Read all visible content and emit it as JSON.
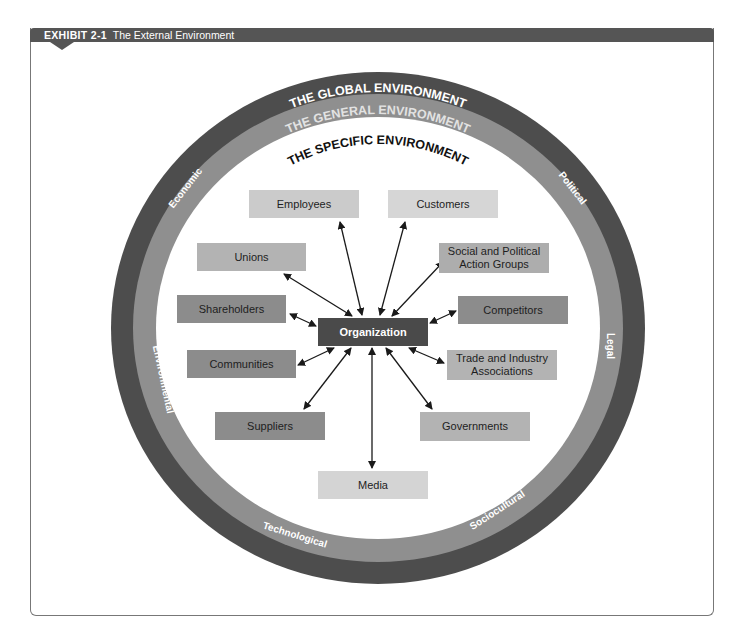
{
  "header": {
    "exhibit_number": "EXHIBIT 2-1",
    "title": "The External Environment",
    "bar_color": "#555555"
  },
  "rings": {
    "global": {
      "label": "THE GLOBAL ENVIRONMENT",
      "color": "#4d4d4d"
    },
    "general": {
      "label": "THE GENERAL ENVIRONMENT",
      "color": "#8f8f8f",
      "segments": [
        "Economic",
        "Political",
        "Legal",
        "Sociocultural",
        "Technological",
        "Environmental"
      ]
    },
    "specific": {
      "label": "THE SPECIFIC ENVIRONMENT",
      "color": "#ffffff"
    }
  },
  "center": {
    "label": "Organization",
    "color": "#4a4a4a"
  },
  "stakeholders": [
    {
      "id": "employees",
      "label": "Employees",
      "color": "#cbcbcb"
    },
    {
      "id": "customers",
      "label": "Customers",
      "color": "#d6d6d6"
    },
    {
      "id": "unions",
      "label": "Unions",
      "color": "#b3b3b3"
    },
    {
      "id": "social-political",
      "label": "Social and Political Action Groups",
      "color": "#adadad"
    },
    {
      "id": "shareholders",
      "label": "Shareholders",
      "color": "#8c8c8c"
    },
    {
      "id": "competitors",
      "label": "Competitors",
      "color": "#8c8c8c"
    },
    {
      "id": "communities",
      "label": "Communities",
      "color": "#8c8c8c"
    },
    {
      "id": "trade-industry",
      "label": "Trade and Industry Associations",
      "color": "#b3b3b3"
    },
    {
      "id": "suppliers",
      "label": "Suppliers",
      "color": "#8c8c8c"
    },
    {
      "id": "governments",
      "label": "Governments",
      "color": "#b3b3b3"
    },
    {
      "id": "media",
      "label": "Media",
      "color": "#d4d4d4"
    }
  ]
}
